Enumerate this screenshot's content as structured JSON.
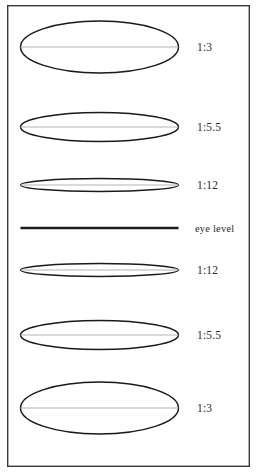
{
  "figure": {
    "frame": {
      "x": 7,
      "y": 5,
      "width": 243,
      "height": 462,
      "stroke_color": "#3a3a3a"
    },
    "colors": {
      "outline": "#1a1a1a",
      "axis": "#b4b4b4",
      "horizon": "#1c1c1c",
      "label": "#2b2b2b",
      "background": "#ffffff"
    },
    "ellipse_geometry": {
      "center_x": 99.5,
      "radius_x": 79
    },
    "rows": [
      {
        "id": "row-above-1-3",
        "label": "1:3",
        "ratio": "1:3",
        "kind": "ellipse",
        "center_y": 47,
        "radius_y": 26,
        "has_major_axis": true,
        "position": "above-eye-level",
        "label_x": 197,
        "label_y": 51
      },
      {
        "id": "row-above-1-5-5",
        "label": "1:5.5",
        "ratio": "1:5.5",
        "kind": "ellipse",
        "center_y": 127,
        "radius_y": 14.5,
        "has_major_axis": true,
        "position": "above-eye-level",
        "label_x": 197,
        "label_y": 131
      },
      {
        "id": "row-above-1-12",
        "label": "1:12",
        "ratio": "1:12",
        "kind": "ellipse",
        "center_y": 185,
        "radius_y": 6.5,
        "has_major_axis": true,
        "position": "above-eye-level",
        "label_x": 197,
        "label_y": 189
      },
      {
        "id": "row-eye-level",
        "label": "eye level",
        "ratio": "",
        "kind": "line",
        "center_y": 228,
        "radius_y": 0,
        "has_major_axis": false,
        "position": "eye-level",
        "label_x": 195,
        "label_y": 232
      },
      {
        "id": "row-below-1-12",
        "label": "1:12",
        "ratio": "1:12",
        "kind": "ellipse",
        "center_y": 270,
        "radius_y": 6.5,
        "has_major_axis": true,
        "position": "below-eye-level",
        "label_x": 197,
        "label_y": 274
      },
      {
        "id": "row-below-1-5-5",
        "label": "1:5.5",
        "ratio": "1:5.5",
        "kind": "ellipse",
        "center_y": 335,
        "radius_y": 14.5,
        "has_major_axis": true,
        "position": "below-eye-level",
        "label_x": 197,
        "label_y": 339
      },
      {
        "id": "row-below-1-3",
        "label": "1:3",
        "ratio": "1:3",
        "kind": "ellipse",
        "center_y": 408,
        "radius_y": 26,
        "has_major_axis": true,
        "position": "below-eye-level",
        "label_x": 197,
        "label_y": 412
      }
    ]
  }
}
